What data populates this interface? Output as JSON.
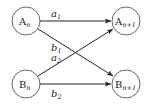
{
  "diagram": {
    "type": "state-transition",
    "nodes": [
      {
        "id": "An",
        "base": "A",
        "subscript": "n",
        "cx": 26,
        "cy": 21,
        "r": 14
      },
      {
        "id": "An1",
        "base": "A",
        "subscript": "n+1",
        "cx": 126,
        "cy": 21,
        "r": 14
      },
      {
        "id": "Bn",
        "base": "B",
        "subscript": "n",
        "cx": 26,
        "cy": 84,
        "r": 14
      },
      {
        "id": "Bn1",
        "base": "B",
        "subscript": "n+1",
        "cx": 126,
        "cy": 84,
        "r": 14
      }
    ],
    "edges": [
      {
        "from": "An",
        "to": "An1",
        "label": "a",
        "label_sub": "1"
      },
      {
        "from": "An",
        "to": "Bn1",
        "label": "b",
        "label_sub": "1"
      },
      {
        "from": "Bn",
        "to": "An1",
        "label": "a",
        "label_sub": "2"
      },
      {
        "from": "Bn",
        "to": "Bn1",
        "label": "b",
        "label_sub": "2"
      }
    ],
    "colors": {
      "stroke": "#222222",
      "node_stroke": "#555555",
      "background": "#ffffff"
    }
  }
}
